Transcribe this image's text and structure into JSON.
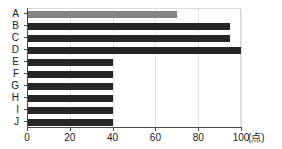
{
  "chart_data": {
    "type": "bar",
    "orientation": "horizontal",
    "title": "",
    "subtitle": "",
    "xlabel": "(点)",
    "ylabel": "",
    "categories": [
      "A",
      "B",
      "C",
      "D",
      "E",
      "F",
      "G",
      "H",
      "I",
      "J"
    ],
    "values": [
      70,
      95,
      95,
      100,
      40,
      40,
      40,
      40,
      40,
      40
    ],
    "series": [
      {
        "name": "",
        "values": [
          70,
          95,
          95,
          100,
          40,
          40,
          40,
          40,
          40,
          40
        ]
      }
    ],
    "xlim": [
      0,
      100
    ],
    "xticks": [
      0,
      20,
      40,
      60,
      80,
      100
    ],
    "xtick_labels": [
      "0",
      "20",
      "40",
      "60",
      "80",
      "100"
    ],
    "grid": true,
    "grid_axis": "x",
    "legend": false,
    "legend_position": "none",
    "highlight_category": "A",
    "colors": {
      "bar": "#262626",
      "bar_highlight": "#838383",
      "axis": "#4a4a4a",
      "grid": "#e2e2e2",
      "background": "#ffffff",
      "text": "#1a1a1a"
    }
  },
  "axis": {
    "unit_label": "(点)"
  }
}
